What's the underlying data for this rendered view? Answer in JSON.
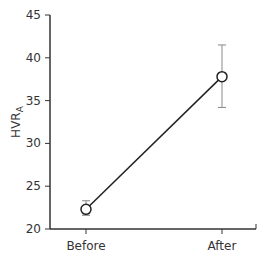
{
  "chart_data": {
    "type": "line",
    "title": "",
    "xlabel": "",
    "ylabel": "HVR",
    "ylabel_subscript": "A",
    "categories": [
      "Before",
      "After"
    ],
    "series": [
      {
        "name": "HVR_A",
        "values": [
          22.3,
          37.8
        ],
        "error_upper": [
          23.3,
          41.5
        ],
        "error_lower": [
          21.6,
          34.2
        ]
      }
    ],
    "ylim": [
      20,
      45
    ],
    "yticks": [
      20,
      25,
      30,
      35,
      40,
      45
    ],
    "ytick_labels": [
      "20",
      "25",
      "30",
      "35",
      "40",
      "45"
    ],
    "grid": false,
    "legend": "none",
    "marker": "open-circle"
  },
  "colors": {
    "axis": "#333333",
    "line": "#222222",
    "errorbar": "#888888",
    "marker_fill": "#ffffff"
  }
}
